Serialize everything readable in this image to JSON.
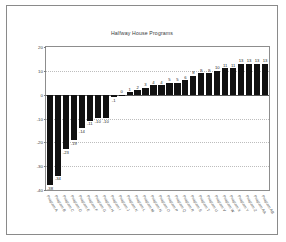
{
  "chart_data": {
    "type": "bar",
    "title": "Halfway House Programs",
    "xlabel": "",
    "ylabel": "Change in Recidivism Rates",
    "ylim": [
      -40,
      20
    ],
    "yticks": [
      20,
      10,
      0,
      -10,
      -20,
      -30,
      -40
    ],
    "grid": true,
    "legend": false,
    "categories": [
      "Program A",
      "Program B",
      "Program C",
      "Program D",
      "Program E",
      "Program F",
      "Program G",
      "Program H",
      "Program I",
      "Program J",
      "Program K",
      "Program L",
      "Program M",
      "Program N",
      "Program O",
      "Program P",
      "Program Q",
      "Program R",
      "Program S",
      "Program T",
      "Program U",
      "Program V",
      "Program W",
      "Program X",
      "Program Y",
      "Program Z",
      "Program AA",
      "Program AB"
    ],
    "values": [
      -38,
      -34,
      -23,
      -19,
      -14,
      -11,
      -10,
      -10,
      -1,
      0,
      1,
      2,
      3,
      4,
      4,
      5,
      5,
      6,
      8,
      9,
      9,
      10,
      11,
      11,
      13,
      13,
      13,
      13
    ],
    "bar_color": "#111111",
    "grid_color": "#bdbdbd",
    "axis_color": "#8d8d8d"
  }
}
